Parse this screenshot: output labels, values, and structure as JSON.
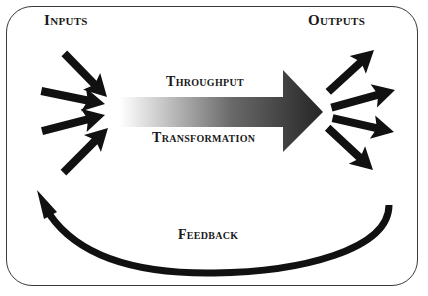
{
  "diagram": {
    "labels": {
      "inputs": "Inputs",
      "outputs": "Outputs",
      "throughput": "Throughput",
      "transformation": "Transformation",
      "feedback": "Feedback"
    },
    "colors": {
      "arrow": "#111111",
      "gradient_start": "#ffffff",
      "gradient_end": "#2a2a2a",
      "border": "#3a3a3a"
    },
    "input_arrow_count": 4,
    "output_arrow_count": 4
  }
}
